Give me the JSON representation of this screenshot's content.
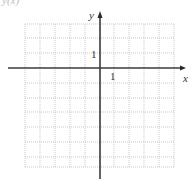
{
  "header": {
    "partial_text": "y(x)"
  },
  "diagram": {
    "type": "coordinate-grid",
    "x_axis_label": "x",
    "y_axis_label": "y",
    "x_tick_label": "1",
    "y_tick_label": "1",
    "grid": {
      "cell_px": 14.8,
      "x_min_units": -5,
      "x_max_units": 5,
      "y_min_units": -7,
      "y_max_units": 3
    },
    "colors": {
      "axis": "#3a3a3a",
      "grid": "#c9c9c9",
      "background": "#ffffff"
    }
  }
}
